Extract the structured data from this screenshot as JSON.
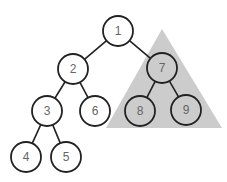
{
  "diagram": {
    "type": "binary-tree",
    "highlight": {
      "shape": "triangle",
      "color": "#cccccc",
      "covers_subtree_root": "7",
      "points": [
        [
          162,
          29
        ],
        [
          106,
          128
        ],
        [
          222,
          128
        ]
      ]
    },
    "style": {
      "node_fill": "#ffffff",
      "node_fill_highlighted": "#cccccc",
      "stroke": "#222222",
      "label_color": "#666666"
    },
    "nodes": [
      {
        "id": "1",
        "label": "1",
        "x": 118,
        "y": 31,
        "highlighted": false
      },
      {
        "id": "2",
        "label": "2",
        "x": 73,
        "y": 69,
        "highlighted": false
      },
      {
        "id": "7",
        "label": "7",
        "x": 162,
        "y": 68,
        "highlighted": true
      },
      {
        "id": "3",
        "label": "3",
        "x": 47,
        "y": 111,
        "highlighted": false
      },
      {
        "id": "6",
        "label": "6",
        "x": 95,
        "y": 111,
        "highlighted": false
      },
      {
        "id": "8",
        "label": "8",
        "x": 140,
        "y": 111,
        "highlighted": true
      },
      {
        "id": "9",
        "label": "9",
        "x": 186,
        "y": 110,
        "highlighted": true
      },
      {
        "id": "4",
        "label": "4",
        "x": 26,
        "y": 157,
        "highlighted": false
      },
      {
        "id": "5",
        "label": "5",
        "x": 66,
        "y": 157,
        "highlighted": false
      }
    ],
    "edges": [
      [
        "1",
        "2"
      ],
      [
        "1",
        "7"
      ],
      [
        "2",
        "3"
      ],
      [
        "2",
        "6"
      ],
      [
        "7",
        "8"
      ],
      [
        "7",
        "9"
      ],
      [
        "3",
        "4"
      ],
      [
        "3",
        "5"
      ]
    ]
  }
}
